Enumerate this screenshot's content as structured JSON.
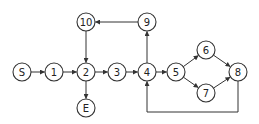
{
  "diagram": {
    "type": "control-flow-graph",
    "nodes": [
      {
        "id": "S",
        "label": "S",
        "x": 22,
        "y": 72
      },
      {
        "id": "1",
        "label": "1",
        "x": 54,
        "y": 72
      },
      {
        "id": "2",
        "label": "2",
        "x": 86,
        "y": 72
      },
      {
        "id": "3",
        "label": "3",
        "x": 117,
        "y": 72
      },
      {
        "id": "4",
        "label": "4",
        "x": 147,
        "y": 72
      },
      {
        "id": "5",
        "label": "5",
        "x": 176,
        "y": 72
      },
      {
        "id": "6",
        "label": "6",
        "x": 206,
        "y": 50
      },
      {
        "id": "7",
        "label": "7",
        "x": 206,
        "y": 93
      },
      {
        "id": "8",
        "label": "8",
        "x": 238,
        "y": 72
      },
      {
        "id": "9",
        "label": "9",
        "x": 147,
        "y": 22
      },
      {
        "id": "10",
        "label": "10",
        "x": 86,
        "y": 22
      },
      {
        "id": "E",
        "label": "E",
        "x": 86,
        "y": 108
      }
    ],
    "edges": [
      {
        "from": "S",
        "to": "1"
      },
      {
        "from": "1",
        "to": "2"
      },
      {
        "from": "2",
        "to": "3"
      },
      {
        "from": "3",
        "to": "4"
      },
      {
        "from": "4",
        "to": "5"
      },
      {
        "from": "5",
        "to": "6"
      },
      {
        "from": "5",
        "to": "7"
      },
      {
        "from": "6",
        "to": "8"
      },
      {
        "from": "7",
        "to": "8"
      },
      {
        "from": "8",
        "to": "4",
        "route": "below"
      },
      {
        "from": "4",
        "to": "9"
      },
      {
        "from": "9",
        "to": "10"
      },
      {
        "from": "10",
        "to": "2"
      },
      {
        "from": "2",
        "to": "E"
      }
    ],
    "colors": {
      "stroke": "#333333",
      "fill": "#ffffff",
      "text": "#222222"
    }
  }
}
